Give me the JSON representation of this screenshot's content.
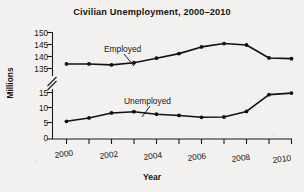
{
  "chart_data": {
    "type": "line",
    "title": "Civilian Unemployment, 2000–2010",
    "xlabel": "Year",
    "ylabel": "Millions",
    "x": [
      2000,
      2001,
      2002,
      2003,
      2004,
      2005,
      2006,
      2007,
      2008,
      2009,
      2010
    ],
    "categories": [
      "2000",
      "2001",
      "2002",
      "2003",
      "2004",
      "2005",
      "2006",
      "2007",
      "2008",
      "2009",
      "2010"
    ],
    "series": [
      {
        "name": "Employed",
        "values": [
          136.9,
          136.9,
          136.5,
          137.4,
          139.3,
          141.2,
          144.0,
          145.4,
          144.8,
          139.4,
          139.1
        ],
        "label_text": "Employed"
      },
      {
        "name": "Unemployed",
        "values": [
          5.7,
          6.8,
          8.4,
          8.8,
          8.0,
          7.6,
          7.0,
          7.1,
          8.9,
          14.3,
          14.8
        ],
        "label_text": "Unemployed"
      }
    ],
    "y_axis": {
      "broken": true,
      "break_between": [
        135,
        15
      ],
      "lower_ticks": [
        0,
        5,
        10,
        15
      ],
      "upper_ticks": [
        135,
        140,
        145,
        150
      ],
      "tick_labels": [
        "150",
        "145",
        "140",
        "135",
        "15",
        "10",
        "5",
        "0"
      ]
    },
    "x_axis": {
      "tick_labels": [
        "2000",
        "2002",
        "2004",
        "2006",
        "2008",
        "2010"
      ],
      "xlim": [
        2000,
        2010
      ]
    },
    "grid": false,
    "legend": "inline-annotations",
    "marker": "filled-circle",
    "line_color": "#111111"
  }
}
